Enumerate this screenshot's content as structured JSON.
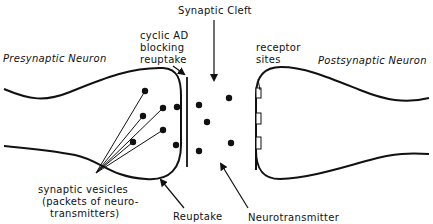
{
  "diagram": {
    "title": "Synaptic Cleft",
    "presynaptic_label": "Presynaptic Neuron",
    "postsynaptic_label": "Postsynaptic Neuron",
    "cyclic_ad": [
      "cyclic AD",
      "blocking",
      "reuptake"
    ],
    "receptor": [
      "receptor",
      "sites"
    ],
    "vesicles": [
      "synaptic vesicles",
      "(packets of neuro-",
      "transmitters)"
    ],
    "reuptake_label": "Reuptake",
    "neurotransmitter_label": "Neurotransmitter",
    "ink_color": "#111111",
    "background_color": "#ffffff"
  }
}
